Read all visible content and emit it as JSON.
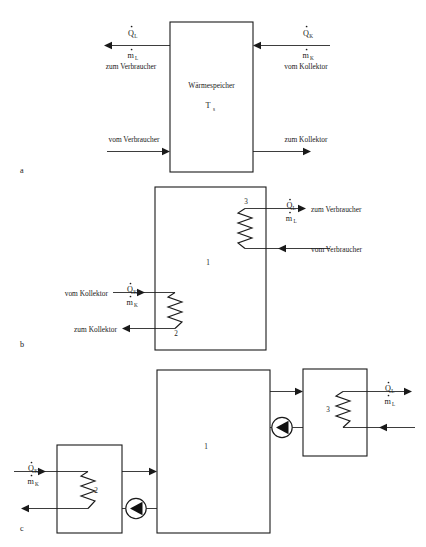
{
  "figure": {
    "panels": [
      {
        "id": "a",
        "panel_label": "a",
        "tank_title": "Wärmespeicher",
        "tank_temperature": "T",
        "tank_temperature_sub": "s",
        "flows": [
          {
            "name": "top-left-outlet",
            "heat_symbol": "Q",
            "heat_sub": "L",
            "mass_symbol": "m",
            "mass_sub": "L",
            "text": "zum Verbraucher",
            "direction": "left"
          },
          {
            "name": "top-right-inlet",
            "heat_symbol": "Q",
            "heat_sub": "K",
            "mass_symbol": "m",
            "mass_sub": "K",
            "text": "vom Kollektor",
            "direction": "left"
          },
          {
            "name": "bottom-left-inlet",
            "text": "vom Verbraucher",
            "direction": "right"
          },
          {
            "name": "bottom-right-outlet",
            "text": "zum Kollektor",
            "direction": "right"
          }
        ]
      },
      {
        "id": "b",
        "panel_label": "b",
        "tank_number": "1",
        "coil_upper_number": "3",
        "coil_lower_number": "2",
        "flows": [
          {
            "name": "load-supply",
            "heat_symbol": "Q",
            "heat_sub": "L",
            "mass_symbol": "m",
            "mass_sub": "L",
            "text": "zum Verbraucher",
            "direction": "right"
          },
          {
            "name": "load-return",
            "text": "vom Verbraucher",
            "direction": "left"
          },
          {
            "name": "collector-supply",
            "heat_symbol": "Q",
            "heat_sub": "K",
            "mass_symbol": "m",
            "mass_sub": "K",
            "text": "vom Kollektor",
            "direction": "right"
          },
          {
            "name": "collector-return",
            "text": "zum Kollektor",
            "direction": "left"
          }
        ]
      },
      {
        "id": "c",
        "panel_label": "c",
        "tank_number": "1",
        "hx_left_number": "2",
        "hx_right_number": "3",
        "flows": [
          {
            "name": "collector-supply",
            "heat_symbol": "Q",
            "heat_sub": "K",
            "mass_symbol": "m",
            "mass_sub": "K",
            "direction": "right"
          },
          {
            "name": "collector-return",
            "direction": "left"
          },
          {
            "name": "load-supply",
            "heat_symbol": "Q",
            "heat_sub": "L",
            "mass_symbol": "m",
            "mass_sub": "L",
            "direction": "right"
          },
          {
            "name": "load-return",
            "direction": "left"
          }
        ],
        "pumps": [
          {
            "name": "pump-collector-loop"
          },
          {
            "name": "pump-load-loop"
          }
        ]
      }
    ],
    "colors": {
      "ink": "#1a1a1a",
      "background": "#ffffff"
    }
  }
}
